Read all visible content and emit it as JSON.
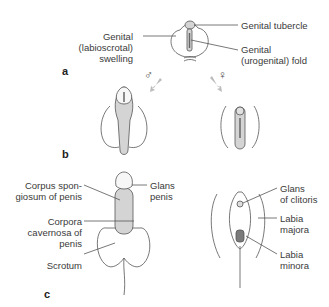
{
  "figure": {
    "panels": {
      "a": "a",
      "b": "b",
      "c": "c"
    },
    "symbols": {
      "male": "♂",
      "female": "♀"
    },
    "labels": {
      "genital_swelling": [
        "Genital",
        "(labioscrotal)",
        "swelling"
      ],
      "genital_tubercle": "Genital tubercle",
      "genital_fold": [
        "Genital",
        "(urogenital) fold"
      ],
      "corpus_spongiosum": [
        "Corpus spon-",
        "giosum of penis"
      ],
      "corpora_cavernosa": [
        "Corpora",
        "cavernosa of",
        "penis"
      ],
      "scrotum": "Scrotum",
      "glans_penis": [
        "Glans",
        "penis"
      ],
      "glans_clitoris": [
        "Glans",
        "of clitoris"
      ],
      "labia_majora": [
        "Labia",
        "majora"
      ],
      "labia_minora": [
        "Labia",
        "minora"
      ]
    },
    "colors": {
      "line": "#555555",
      "fill": "#d4d4d4",
      "dark": "#7a7a7a",
      "arrow": "#b5b5b5"
    }
  }
}
